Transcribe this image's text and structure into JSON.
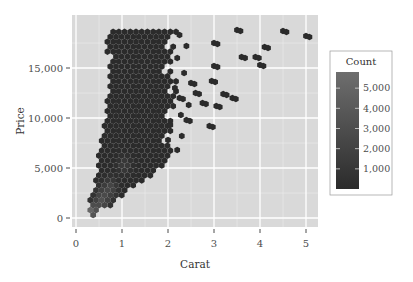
{
  "chart_data": {
    "type": "heatmap",
    "subtype": "hexbin",
    "title": "",
    "xlabel": "Carat",
    "ylabel": "Price",
    "xlim": [
      0,
      5
    ],
    "ylim": [
      0,
      19000
    ],
    "x_ticks": [
      0,
      1,
      2,
      3,
      4,
      5
    ],
    "x_tick_labels": [
      "0",
      "1",
      "2",
      "3",
      "4",
      "5"
    ],
    "y_ticks": [
      0,
      5000,
      10000,
      15000
    ],
    "y_tick_labels": [
      "0",
      "5,000",
      "10,000",
      "15,000"
    ],
    "grid": true,
    "legend": {
      "title": "Count",
      "position": "right",
      "type": "colorbar",
      "ticks": [
        1000,
        2000,
        3000,
        4000,
        5000
      ],
      "tick_labels": [
        "1,000",
        "2,000",
        "3,000",
        "4,000",
        "5,000"
      ],
      "range": [
        1,
        5800
      ],
      "color_low": "#2b2b2b",
      "color_high": "#6e6e6e"
    },
    "outlier_hexes": [
      {
        "carat": 2.25,
        "price": 12000
      },
      {
        "carat": 2.4,
        "price": 9800
      },
      {
        "carat": 2.5,
        "price": 13500
      },
      {
        "carat": 2.6,
        "price": 12500
      },
      {
        "carat": 2.75,
        "price": 11500
      },
      {
        "carat": 2.9,
        "price": 9200
      },
      {
        "carat": 2.95,
        "price": 13700
      },
      {
        "carat": 3.0,
        "price": 17500
      },
      {
        "carat": 3.0,
        "price": 15200
      },
      {
        "carat": 3.05,
        "price": 11200
      },
      {
        "carat": 3.2,
        "price": 12400
      },
      {
        "carat": 3.4,
        "price": 12000
      },
      {
        "carat": 3.5,
        "price": 18800
      },
      {
        "carat": 3.6,
        "price": 16100
      },
      {
        "carat": 3.9,
        "price": 16100
      },
      {
        "carat": 4.0,
        "price": 15300
      },
      {
        "carat": 4.1,
        "price": 17100
      },
      {
        "carat": 4.5,
        "price": 18700
      },
      {
        "carat": 5.0,
        "price": 18200
      }
    ]
  }
}
